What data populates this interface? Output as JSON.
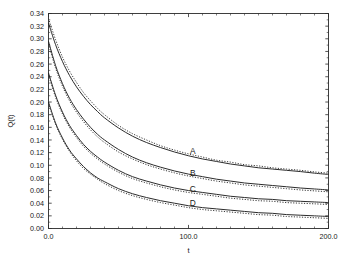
{
  "chart_data": {
    "type": "line",
    "title": "",
    "xlabel": "t",
    "ylabel": "Q(t)",
    "xlim": [
      0.0,
      200.0
    ],
    "ylim": [
      0.0,
      0.34
    ],
    "grid": false,
    "legend_position": "inline-curve-labels",
    "x_ticks": [
      "0.0",
      "100.0",
      "200.0"
    ],
    "x_tick_values": [
      0.0,
      100.0,
      200.0
    ],
    "x_minor_tick_step": 10.0,
    "y_ticks": [
      "0.00",
      "0.02",
      "0.04",
      "0.06",
      "0.08",
      "0.10",
      "0.12",
      "0.14",
      "0.16",
      "0.18",
      "0.20",
      "0.22",
      "0.24",
      "0.26",
      "0.28",
      "0.30",
      "0.32",
      "0.34"
    ],
    "y_tick_values": [
      0.0,
      0.02,
      0.04,
      0.06,
      0.08,
      0.1,
      0.12,
      0.14,
      0.16,
      0.18,
      0.2,
      0.22,
      0.24,
      0.26,
      0.28,
      0.3,
      0.32,
      0.34
    ],
    "x": [
      0,
      5,
      10,
      15,
      20,
      25,
      30,
      35,
      40,
      50,
      60,
      70,
      80,
      90,
      100,
      110,
      120,
      130,
      140,
      150,
      160,
      170,
      180,
      190,
      200
    ],
    "series": [
      {
        "name": "A",
        "style": "solid",
        "label": "A",
        "label_x": 103,
        "label_y": 0.118,
        "values": [
          0.325,
          0.291,
          0.264,
          0.242,
          0.224,
          0.209,
          0.196,
          0.185,
          0.175,
          0.159,
          0.146,
          0.136,
          0.128,
          0.121,
          0.115,
          0.11,
          0.106,
          0.102,
          0.099,
          0.096,
          0.094,
          0.092,
          0.09,
          0.0875,
          0.0855
        ]
      },
      {
        "name": "A-dotted",
        "style": "dotted",
        "label": "",
        "values": [
          0.332,
          0.299,
          0.271,
          0.249,
          0.231,
          0.215,
          0.202,
          0.19,
          0.18,
          0.163,
          0.15,
          0.14,
          0.131,
          0.124,
          0.118,
          0.113,
          0.108,
          0.105,
          0.101,
          0.099,
          0.096,
          0.094,
          0.092,
          0.0895,
          0.0875
        ]
      },
      {
        "name": "B",
        "style": "solid",
        "label": "B",
        "label_x": 103,
        "label_y": 0.083,
        "values": [
          0.296,
          0.258,
          0.229,
          0.206,
          0.188,
          0.173,
          0.16,
          0.149,
          0.14,
          0.125,
          0.113,
          0.104,
          0.097,
          0.091,
          0.086,
          0.082,
          0.078,
          0.075,
          0.072,
          0.07,
          0.068,
          0.066,
          0.064,
          0.0625,
          0.061
        ]
      },
      {
        "name": "B-dotted",
        "style": "dotted",
        "label": "",
        "values": [
          0.292,
          0.254,
          0.225,
          0.202,
          0.184,
          0.169,
          0.156,
          0.145,
          0.136,
          0.121,
          0.11,
          0.101,
          0.094,
          0.088,
          0.083,
          0.079,
          0.075,
          0.072,
          0.069,
          0.067,
          0.065,
          0.063,
          0.061,
          0.0595,
          0.058
        ]
      },
      {
        "name": "C",
        "style": "solid",
        "label": "C",
        "label_x": 103,
        "label_y": 0.058,
        "values": [
          0.246,
          0.211,
          0.184,
          0.163,
          0.147,
          0.133,
          0.122,
          0.113,
          0.105,
          0.092,
          0.082,
          0.075,
          0.069,
          0.064,
          0.06,
          0.057,
          0.054,
          0.051,
          0.049,
          0.047,
          0.046,
          0.044,
          0.043,
          0.042,
          0.041
        ]
      },
      {
        "name": "C-dotted",
        "style": "dotted",
        "label": "",
        "values": [
          0.243,
          0.208,
          0.181,
          0.16,
          0.144,
          0.13,
          0.119,
          0.11,
          0.102,
          0.089,
          0.079,
          0.072,
          0.066,
          0.061,
          0.057,
          0.054,
          0.051,
          0.048,
          0.046,
          0.044,
          0.043,
          0.041,
          0.04,
          0.039,
          0.038
        ]
      },
      {
        "name": "D",
        "style": "solid",
        "label": "D",
        "label_x": 103,
        "label_y": 0.036,
        "values": [
          0.2,
          0.167,
          0.143,
          0.124,
          0.11,
          0.098,
          0.088,
          0.08,
          0.074,
          0.063,
          0.055,
          0.049,
          0.044,
          0.04,
          0.036,
          0.033,
          0.031,
          0.029,
          0.027,
          0.025,
          0.024,
          0.022,
          0.021,
          0.02,
          0.019
        ]
      },
      {
        "name": "D-dotted",
        "style": "dotted",
        "label": "",
        "values": [
          0.198,
          0.165,
          0.141,
          0.122,
          0.107,
          0.095,
          0.086,
          0.078,
          0.071,
          0.06,
          0.052,
          0.046,
          0.041,
          0.037,
          0.033,
          0.03,
          0.028,
          0.026,
          0.024,
          0.022,
          0.021,
          0.019,
          0.018,
          0.017,
          0.016
        ]
      }
    ]
  }
}
